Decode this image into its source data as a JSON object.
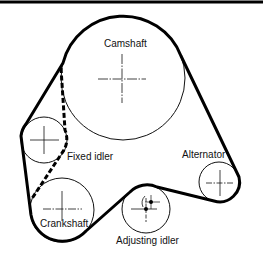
{
  "diagram": {
    "colors": {
      "belt": "#000000",
      "pulley": "#111111",
      "background": "#ffffff"
    },
    "pulleys": [
      {
        "id": "camshaft",
        "label": "Camshaft"
      },
      {
        "id": "fixed-idler",
        "label": "Fixed idler"
      },
      {
        "id": "alternator",
        "label": "Alternator"
      },
      {
        "id": "crankshaft",
        "label": "Crankshaft"
      },
      {
        "id": "adjusting-idler",
        "label": "Adjusting idler"
      }
    ]
  }
}
